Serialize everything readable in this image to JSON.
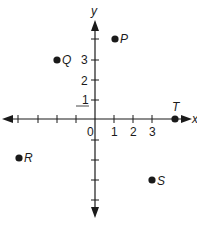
{
  "diagram": {
    "type": "coordinate-plane",
    "axes": {
      "x_label": "x",
      "y_label": "y",
      "origin_label": "0",
      "x_tick_labels": [
        "1",
        "2",
        "3"
      ],
      "y_tick_labels": [
        "1",
        "2",
        "3"
      ],
      "x_range": [
        -5,
        4
      ],
      "y_range": [
        -5,
        5
      ]
    },
    "points": [
      {
        "name": "P",
        "x": 1,
        "y": 4
      },
      {
        "name": "Q",
        "x": -2,
        "y": 3
      },
      {
        "name": "R",
        "x": -4,
        "y": -2
      },
      {
        "name": "S",
        "x": 3,
        "y": -3
      },
      {
        "name": "T",
        "x": 4,
        "y": 0
      }
    ],
    "colors": {
      "ink": "#1a1a1a",
      "background": "#ffffff"
    }
  }
}
